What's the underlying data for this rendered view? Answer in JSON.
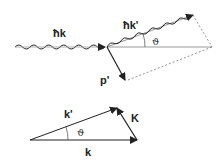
{
  "diagram": {
    "top": {
      "incident_label": "ħk",
      "scattered_label": "ħk'",
      "electron_label": "p'",
      "angle_label": "ϑ"
    },
    "bottom": {
      "k_label": "k",
      "kprime_label": "k'",
      "K_label": "K",
      "angle_label": "ϑ"
    },
    "colors": {
      "stroke": "#222222",
      "line": "#888888",
      "dashed": "#777777"
    }
  }
}
